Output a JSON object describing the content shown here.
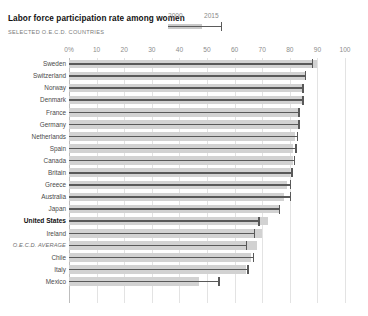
{
  "header": {
    "title": "Labor force participation rate among women",
    "subtitle": "SELECTED O.E.C.D. COUNTRIES"
  },
  "legend": {
    "series_a": "2000",
    "series_b": "2015",
    "color_2000": "#d2d2d2",
    "color_2015": "#595959"
  },
  "axis": {
    "ticks": [
      "0%",
      "10",
      "20",
      "30",
      "40",
      "50",
      "60",
      "70",
      "80",
      "90",
      "100"
    ],
    "min": 0,
    "max": 100
  },
  "chart_data": {
    "type": "bar",
    "title": "Labor force participation rate among women",
    "subtitle": "SELECTED O.E.C.D. COUNTRIES",
    "xlabel": "",
    "ylabel": "",
    "xlim": [
      0,
      100
    ],
    "grid": true,
    "legend_position": "top-center",
    "categories": [
      "Sweden",
      "Switzerland",
      "Norway",
      "Denmark",
      "France",
      "Germany",
      "Netherlands",
      "Spain",
      "Canada",
      "Britain",
      "Greece",
      "Australia",
      "Japan",
      "United States",
      "Ireland",
      "O.E.C.D. AVERAGE",
      "Chile",
      "Italy",
      "Mexico"
    ],
    "series": [
      {
        "name": "2000",
        "values": [
          90,
          86,
          85,
          85,
          83,
          83,
          82,
          81,
          81,
          80,
          79,
          78,
          76,
          72,
          70,
          68,
          66,
          64,
          47
        ]
      },
      {
        "name": "2015",
        "values": [
          88,
          85.5,
          84.5,
          84.5,
          83,
          83,
          82.5,
          82,
          81.5,
          80.5,
          80,
          80,
          76,
          68.5,
          67,
          64,
          66.5,
          64.5,
          54
        ]
      }
    ],
    "rows": [
      {
        "label": "Sweden",
        "v2000": 90,
        "v2015": 88,
        "emphasis": "none"
      },
      {
        "label": "Switzerland",
        "v2000": 86,
        "v2015": 85.5,
        "emphasis": "none"
      },
      {
        "label": "Norway",
        "v2000": 85,
        "v2015": 84.5,
        "emphasis": "none"
      },
      {
        "label": "Denmark",
        "v2000": 85,
        "v2015": 84.5,
        "emphasis": "none"
      },
      {
        "label": "France",
        "v2000": 83,
        "v2015": 83,
        "emphasis": "none"
      },
      {
        "label": "Germany",
        "v2000": 83,
        "v2015": 83,
        "emphasis": "none"
      },
      {
        "label": "Netherlands",
        "v2000": 82,
        "v2015": 82.5,
        "emphasis": "none"
      },
      {
        "label": "Spain",
        "v2000": 81,
        "v2015": 82,
        "emphasis": "none"
      },
      {
        "label": "Canada",
        "v2000": 81,
        "v2015": 81.5,
        "emphasis": "none"
      },
      {
        "label": "Britain",
        "v2000": 80,
        "v2015": 80.5,
        "emphasis": "none"
      },
      {
        "label": "Greece",
        "v2000": 79,
        "v2015": 80,
        "emphasis": "none"
      },
      {
        "label": "Australia",
        "v2000": 78,
        "v2015": 80,
        "emphasis": "none"
      },
      {
        "label": "Japan",
        "v2000": 76,
        "v2015": 76,
        "emphasis": "none"
      },
      {
        "label": "United States",
        "v2000": 72,
        "v2015": 68.5,
        "emphasis": "bold"
      },
      {
        "label": "Ireland",
        "v2000": 70,
        "v2015": 67,
        "emphasis": "none"
      },
      {
        "label": "O.E.C.D. AVERAGE",
        "v2000": 68,
        "v2015": 64,
        "emphasis": "italic"
      },
      {
        "label": "Chile",
        "v2000": 66,
        "v2015": 66.5,
        "emphasis": "none"
      },
      {
        "label": "Italy",
        "v2000": 64,
        "v2015": 64.5,
        "emphasis": "none"
      },
      {
        "label": "Mexico",
        "v2000": 47,
        "v2015": 54,
        "emphasis": "none"
      }
    ]
  }
}
